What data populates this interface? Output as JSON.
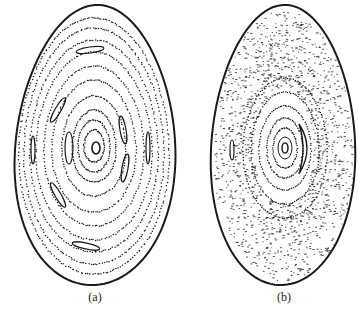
{
  "figure": {
    "panels": [
      {
        "id": "a",
        "label": "(a)",
        "description": "Poincaré section with nested closed flux surfaces and magnetic islands",
        "boundary": {
          "cx": 95,
          "cy": 145,
          "rx": 80,
          "ry": 140
        },
        "center": {
          "x": 96,
          "y": 148
        }
      },
      {
        "id": "b",
        "label": "(b)",
        "description": "Poincaré section with stochastic (scattered) field lines surrounding a core of closed surfaces",
        "boundary": {
          "cx": 283,
          "cy": 145,
          "rx": 72,
          "ry": 140
        },
        "center": {
          "x": 285,
          "y": 148
        }
      }
    ],
    "colors": {
      "ink": "#1a1a1a",
      "background": "#ffffff"
    }
  }
}
